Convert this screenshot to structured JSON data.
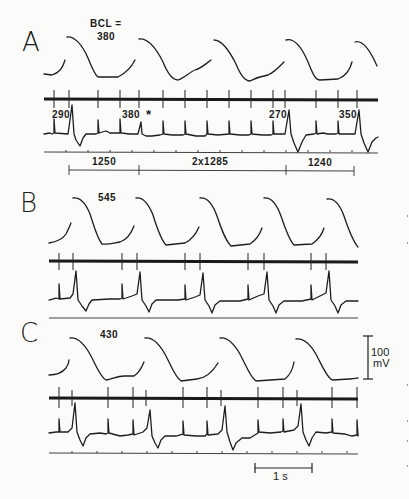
{
  "figure": {
    "panels": [
      {
        "id": "A",
        "label": "A",
        "bcl_prefix": "BCL =",
        "bcl_value": "380",
        "ecg_annotations": [
          "290",
          "380",
          "*",
          "270",
          "350"
        ],
        "intervals": [
          "1250",
          "2x1285",
          "1240"
        ]
      },
      {
        "id": "B",
        "label": "B",
        "bcl_value": "545"
      },
      {
        "id": "C",
        "label": "C",
        "bcl_value": "430"
      }
    ],
    "voltage_scale": {
      "value": "100",
      "unit": "mV"
    },
    "time_scale": {
      "label": "1 s"
    }
  },
  "colors": {
    "ink": "#1e1e1e",
    "background": "#fbfbfa"
  }
}
